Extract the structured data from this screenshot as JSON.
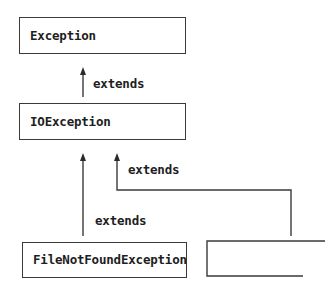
{
  "diagram": {
    "type": "class-hierarchy",
    "nodes": [
      {
        "id": "exception",
        "label": "Exception"
      },
      {
        "id": "ioexception",
        "label": "IOException"
      },
      {
        "id": "filenotfound",
        "label": "FileNotFoundException"
      },
      {
        "id": "unnamed",
        "label": ""
      }
    ],
    "edges": [
      {
        "from": "ioexception",
        "to": "exception",
        "label": "extends"
      },
      {
        "from": "filenotfound",
        "to": "ioexception",
        "label": "extends"
      },
      {
        "from": "unnamed",
        "to": "ioexception",
        "label": "extends"
      }
    ],
    "colors": {
      "line": "#3a3a3a",
      "text": "#1e1e1e",
      "background": "#ffffff"
    }
  }
}
